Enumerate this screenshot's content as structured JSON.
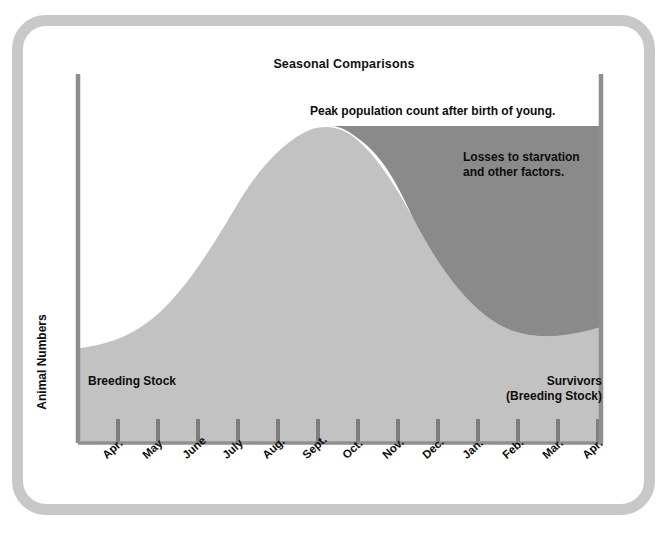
{
  "chart_data": {
    "type": "area",
    "title": "Seasonal Comparisons",
    "xlabel": "",
    "ylabel": "Animal Numbers",
    "grid": false,
    "legend": "none",
    "categories": [
      "Apr.",
      "May",
      "June",
      "July",
      "Aug.",
      "Sept.",
      "Oct.",
      "Nov.",
      "Dec.",
      "Jan.",
      "Feb.",
      "Mar.",
      "Apr."
    ],
    "xlim": [
      0,
      12
    ],
    "ylim": [
      0,
      100
    ],
    "series": [
      {
        "name": "Animal population",
        "fill": "#c2c2c2",
        "values": [
          22,
          30,
          45,
          66,
          86,
          97,
          100,
          95,
          81,
          62,
          44,
          32,
          26
        ]
      },
      {
        "name": "Losses to starvation and other factors",
        "fill": "#8a8a8a",
        "note": "Region between the peak population level and the declining curve, from the peak month (Oct.) to the end (Apr.)",
        "values": [
          null,
          null,
          null,
          null,
          null,
          null,
          0,
          5,
          19,
          38,
          56,
          68,
          74
        ]
      }
    ],
    "annotations": [
      {
        "id": "peak",
        "text": "Peak population count after birth of young."
      },
      {
        "id": "losses",
        "text": "Losses to starvation\nand other factors."
      },
      {
        "id": "breeding_stock",
        "text": "Breeding Stock"
      },
      {
        "id": "survivors",
        "text": "Survivors\n(Breeding Stock)"
      }
    ]
  },
  "chart": {
    "title": "Seasonal Comparisons",
    "y_axis_label": "Animal Numbers",
    "x_tick_labels": [
      "Apr.",
      "May",
      "June",
      "July",
      "Aug.",
      "Sept.",
      "Oct.",
      "Nov.",
      "Dec.",
      "Jan.",
      "Feb.",
      "Mar.",
      "Apr."
    ],
    "annotations": {
      "peak": "Peak population count after birth of young.",
      "losses": "Losses to starvation\nand other factors.",
      "breeding_stock": "Breeding Stock",
      "survivors": "Survivors\n(Breeding Stock)"
    },
    "colors": {
      "population_fill": "#c2c2c2",
      "losses_fill": "#8a8a8a",
      "axis": "#808080",
      "frame": "#c8c8c8",
      "text": "#0d0d0d",
      "background": "#ffffff"
    }
  }
}
